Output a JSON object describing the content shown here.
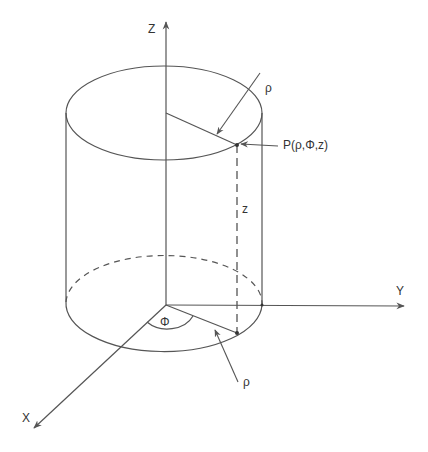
{
  "diagram": {
    "colors": {
      "stroke": "#555555",
      "text": "#333333",
      "background": "#ffffff"
    },
    "axes": {
      "z": {
        "label": "Z"
      },
      "y": {
        "label": "Y"
      },
      "x": {
        "label": "X"
      }
    },
    "point": {
      "label": "P(ρ,Φ,z)"
    },
    "annotations": {
      "rho_top": "ρ",
      "rho_bottom": "ρ",
      "height": "z",
      "angle": "Φ"
    }
  }
}
